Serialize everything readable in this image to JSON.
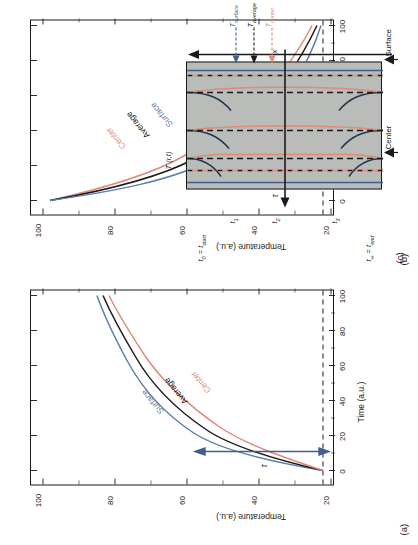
{
  "figure": {
    "panels": [
      {
        "tag": "(a)",
        "process": "heating",
        "xlabel": "Time (a.u.)",
        "ylabel": "Temperature (a.u.)",
        "xticks": [
          "0",
          "20",
          "40",
          "60",
          "80",
          "100"
        ],
        "yticks": [
          "20",
          "40",
          "60",
          "80",
          "100"
        ],
        "curve_labels": [
          "Surface",
          "Average",
          "Center"
        ],
        "tau_label": "τ"
      },
      {
        "tag": "(b)",
        "process": "cooling",
        "xlabel": "Time (a.u.)",
        "ylabel": "Temperature (a.u.)",
        "xticks": [
          "0",
          "20",
          "40",
          "60",
          "80",
          "100"
        ],
        "yticks": [
          "20",
          "40",
          "60",
          "80",
          "100"
        ],
        "curve_labels": [
          "Center",
          "Average",
          "Surface"
        ],
        "tau_label": "τ"
      },
      {
        "tag": "(c)",
        "vertical_axis_label": "T (r,t)",
        "horizontal_axis_label": "x",
        "time_labels": [
          "t0 = tstart",
          "t1",
          "t2",
          "t3",
          "t∞ = tend"
        ],
        "time_labels_rich": [
          {
            "base": "t",
            "sub": "0",
            "rest": " = t",
            "rest_sub": "start"
          },
          {
            "base": "t",
            "sub": "1",
            "rest": "",
            "rest_sub": ""
          },
          {
            "base": "t",
            "sub": "2",
            "rest": "",
            "rest_sub": ""
          },
          {
            "base": "t",
            "sub": "3",
            "rest": "",
            "rest_sub": ""
          },
          {
            "base": "t",
            "sub": "∞",
            "rest": " = t",
            "rest_sub": "end"
          }
        ],
        "temperature_labels": [
          {
            "base": "T",
            "sub": "center",
            "color": "#e08a78"
          },
          {
            "base": "T",
            "sub": "average",
            "color": "#1a1a1a"
          },
          {
            "base": "T",
            "sub": "surface",
            "color": "#3f5f8f"
          }
        ],
        "edge_labels": [
          "Center",
          "Surface"
        ]
      }
    ],
    "colors": {
      "surface": "#5b7fae",
      "average": "#1a1a1a",
      "center": "#e08a78",
      "slab_fill": "#b9bcb8",
      "arrow": "#3f5f8f",
      "axis": "#1a1a1a"
    }
  },
  "chart_data": [
    {
      "type": "line",
      "title": "(a) Heating",
      "xlabel": "Time (a.u.)",
      "ylabel": "Temperature (a.u.)",
      "xlim": [
        0,
        105
      ],
      "ylim": [
        18,
        104
      ],
      "xticks": [
        0,
        20,
        40,
        60,
        80,
        100
      ],
      "yticks": [
        20,
        40,
        60,
        80,
        100
      ],
      "grid": false,
      "legend": "inline-curve-labels",
      "annotations": [
        "τ double-headed arrow at t=0 between ~22 and ~72",
        "dashed horizontal line at T≈22"
      ],
      "x": [
        0,
        5,
        10,
        15,
        20,
        25,
        30,
        35,
        40,
        45,
        50,
        55,
        60,
        65,
        70,
        75,
        80,
        85,
        90,
        95,
        100
      ],
      "series": [
        {
          "name": "Surface",
          "color": "#5b7fae",
          "values": [
            22,
            42,
            56,
            65,
            72,
            77,
            81,
            84,
            86.5,
            88.5,
            90,
            91.2,
            92.2,
            93,
            93.7,
            94.3,
            94.8,
            95.2,
            95.6,
            95.9,
            96.2
          ]
        },
        {
          "name": "Average",
          "color": "#1a1a1a",
          "values": [
            22,
            37,
            50,
            59.5,
            67,
            72.5,
            77,
            80.5,
            83.3,
            85.6,
            87.5,
            89,
            90.3,
            91.4,
            92.3,
            93.1,
            93.8,
            94.3,
            94.8,
            95.2,
            95.5
          ]
        },
        {
          "name": "Center",
          "color": "#e08a78",
          "values": [
            22,
            33,
            45,
            54.5,
            62,
            68,
            73,
            77,
            80.3,
            83,
            85.3,
            87.2,
            88.8,
            90.1,
            91.2,
            92.2,
            93,
            93.7,
            94.3,
            94.8,
            95.2
          ]
        }
      ]
    },
    {
      "type": "line",
      "title": "(b) Cooling",
      "xlabel": "Time (a.u.)",
      "ylabel": "Temperature (a.u.)",
      "xlim": [
        0,
        105
      ],
      "ylim": [
        18,
        104
      ],
      "xticks": [
        0,
        20,
        40,
        60,
        80,
        100
      ],
      "yticks": [
        20,
        40,
        60,
        80,
        100
      ],
      "grid": false,
      "legend": "inline-curve-labels",
      "annotations": [
        "τ double-headed arrow at t=0 between ~22 and ~49",
        "dashed horizontal line at T≈22"
      ],
      "x": [
        0,
        5,
        10,
        15,
        20,
        25,
        30,
        35,
        40,
        45,
        50,
        55,
        60,
        65,
        70,
        75,
        80,
        85,
        90,
        95,
        100
      ],
      "series": [
        {
          "name": "Center",
          "color": "#e08a78",
          "values": [
            98,
            86,
            75,
            66.5,
            60,
            54.5,
            50,
            46.3,
            43.2,
            40.6,
            38.4,
            36.5,
            34.9,
            33.5,
            32.3,
            31.3,
            30.4,
            29.6,
            28.9,
            28.3,
            27.8
          ]
        },
        {
          "name": "Average",
          "color": "#1a1a1a",
          "values": [
            98,
            83,
            71,
            62,
            55,
            49.5,
            45,
            41.4,
            38.4,
            35.9,
            33.8,
            32.1,
            30.6,
            29.3,
            28.2,
            27.3,
            26.5,
            25.8,
            25.2,
            24.7,
            24.3
          ]
        },
        {
          "name": "Surface",
          "color": "#5b7fae",
          "values": [
            98,
            79,
            66,
            56.5,
            49.5,
            44,
            39.8,
            36.4,
            33.7,
            31.5,
            29.7,
            28.2,
            27,
            25.9,
            25,
            24.3,
            23.7,
            23.2,
            22.8,
            22.4,
            22.1
          ]
        }
      ]
    },
    {
      "type": "line",
      "title": "(c) Temperature profiles across slab",
      "xlabel": "x",
      "ylabel": "T (r,t)",
      "grid": false,
      "time_steps": [
        "t0 = tstart",
        "t1",
        "t2",
        "t3",
        "t∞ = tend"
      ],
      "profile_notes": "At each time a dashed black line marks the average, a red curve marks the centre profile and a blue curve marks the surface value; profiles flatten toward t∞.",
      "series": [
        {
          "name": "T_center",
          "color": "#e08a78"
        },
        {
          "name": "T_average",
          "color": "#1a1a1a"
        },
        {
          "name": "T_surface",
          "color": "#3f5f8f"
        }
      ]
    }
  ]
}
